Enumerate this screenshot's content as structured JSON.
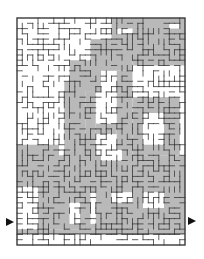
{
  "puzzle": {
    "type": "maze",
    "description": "Rectangular line maze with a gray-shaded hidden picture",
    "colors": {
      "background": "#ffffff",
      "shade": "#b9b9b9",
      "wall": "#3a3a3a",
      "arrow": "#111111"
    },
    "frame": {
      "x": 17,
      "y": 18,
      "width": 168,
      "height": 227
    },
    "entry_arrow": {
      "side": "left",
      "x": 6,
      "y": 222
    },
    "exit_arrow": {
      "side": "right",
      "x": 188,
      "y": 221
    }
  }
}
